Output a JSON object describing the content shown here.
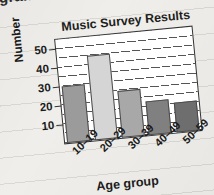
{
  "page": {
    "cropped_word_above": "gram",
    "background": "#efeeea",
    "rule_line_color": "#d9d8d2"
  },
  "chart_data": {
    "type": "bar",
    "title": "Music Survey Results",
    "xlabel": "Age group",
    "ylabel": "Number",
    "categories": [
      "10–19",
      "20–29",
      "30–39",
      "40–49",
      "50–59"
    ],
    "values": [
      30,
      45,
      25,
      18,
      16
    ],
    "ytick_labels": [
      "10",
      "20",
      "30",
      "40",
      "50"
    ],
    "ytick_values": [
      10,
      20,
      30,
      40,
      50
    ],
    "ylim": [
      0,
      55
    ],
    "grid": true,
    "grid_step": 5,
    "legend": "none",
    "bar_colors": [
      "#9b9b9b",
      "#d5d5d5",
      "#a8a8a8",
      "#808080",
      "#6e6e6e"
    ],
    "bar_border_color": "#4a4a4a",
    "plot_background": "#ffffff",
    "axis_color": "#333333"
  }
}
